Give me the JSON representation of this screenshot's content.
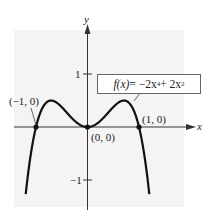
{
  "chart_data": {
    "type": "line",
    "title": "",
    "function_label": "f(x) = -2x^4 + 2x^2",
    "function_label_display": {
      "lhs": "f(x)",
      "eq": " = −2x",
      "exp1": "4",
      "mid": " + 2x",
      "exp2": "2"
    },
    "xlabel": "x",
    "ylabel": "y",
    "x_ticks": [],
    "y_ticks": [
      {
        "value": 1,
        "label": "1"
      },
      {
        "value": -1,
        "label": "−1"
      }
    ],
    "xlim": [
      -1.7,
      2.0
    ],
    "ylim": [
      -1.5,
      1.6
    ],
    "grid": false,
    "legend": "none",
    "series": [
      {
        "name": "f(x) = -2x^4 + 2x^2",
        "x": [
          -1.2,
          -1.1,
          -1.0,
          -0.9,
          -0.8,
          -0.707,
          -0.6,
          -0.5,
          -0.4,
          -0.3,
          -0.2,
          -0.1,
          0,
          0.1,
          0.2,
          0.3,
          0.4,
          0.5,
          0.6,
          0.707,
          0.8,
          0.9,
          1.0,
          1.1,
          1.2
        ],
        "y": [
          -1.27,
          -0.51,
          0,
          0.31,
          0.46,
          0.5,
          0.46,
          0.375,
          0.27,
          0.16,
          0.077,
          0.02,
          0,
          0.02,
          0.077,
          0.16,
          0.27,
          0.375,
          0.46,
          0.5,
          0.46,
          0.31,
          0,
          -0.51,
          -1.27
        ]
      }
    ],
    "annotations": [
      {
        "label": "(−1, 0)",
        "x": -1,
        "y": 0
      },
      {
        "label": "(0, 0)",
        "x": 0,
        "y": 0
      },
      {
        "label": "(1, 0)",
        "x": 1,
        "y": 0
      }
    ]
  },
  "colors": {
    "panel": "#f4f4f4",
    "axis": "#333333",
    "curve": "#111111"
  }
}
